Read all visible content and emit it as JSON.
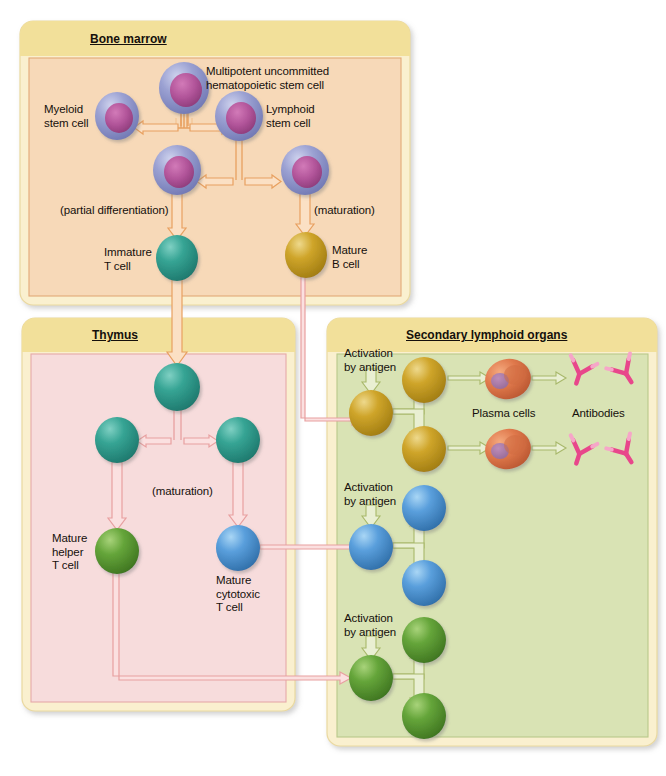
{
  "figure": {
    "panels": [
      {
        "id": "bone-marrow",
        "title": "Bone marrow",
        "header_color": "#f2e09a",
        "body_color": "#f7d9b8",
        "border_color": "#e2a977"
      },
      {
        "id": "thymus",
        "title": "Thymus",
        "header_color": "#f2e09a",
        "body_color": "#f7dcdc",
        "border_color": "#e6a9a9"
      },
      {
        "id": "secondary-lymphoid-organs",
        "title": "Secondary lymphoid organs",
        "header_color": "#f2e09a",
        "body_color": "#d9e3b4",
        "border_color": "#b9c98a"
      }
    ]
  },
  "bone_marrow": {
    "title": "Bone marrow",
    "labels": {
      "multipotent": "Multipotent uncommitted\nhematopoietic stem cell",
      "myeloid": "Myeloid\nstem cell",
      "lymphoid": "Lymphoid\nstem cell",
      "partial_differentiation": "(partial differentiation)",
      "maturation": "(maturation)",
      "immature_t": "Immature\nT cell",
      "mature_b": "Mature\nB cell"
    },
    "cells": [
      {
        "name": "multipotent-hematopoietic-stem-cell",
        "type": "stem",
        "cx": 184,
        "cy": 88,
        "r": 25
      },
      {
        "name": "myeloid-stem-cell",
        "type": "stem",
        "cx": 117,
        "cy": 116,
        "r": 22
      },
      {
        "name": "lymphoid-stem-cell",
        "type": "stem",
        "cx": 239,
        "cy": 116,
        "r": 24
      },
      {
        "name": "pre-t-cell",
        "type": "stem",
        "cx": 177,
        "cy": 170,
        "r": 24
      },
      {
        "name": "pre-b-cell",
        "type": "stem",
        "cx": 305,
        "cy": 170,
        "r": 24
      },
      {
        "name": "immature-t-cell",
        "type": "tcell",
        "cx": 177,
        "cy": 258,
        "r": 21
      },
      {
        "name": "mature-b-cell",
        "type": "bcell",
        "cx": 306,
        "cy": 255,
        "r": 21
      }
    ]
  },
  "thymus": {
    "title": "Thymus",
    "labels": {
      "maturation": "(maturation)",
      "mature_helper": "Mature\nhelper\nT cell",
      "mature_cytotoxic": "Mature\ncytotoxic\nT cell"
    },
    "cells": [
      {
        "name": "thymocyte",
        "type": "tcell",
        "cx": 177,
        "cy": 387,
        "r": 23
      },
      {
        "name": "thymocyte-left",
        "type": "tcell",
        "cx": 117,
        "cy": 440,
        "r": 22
      },
      {
        "name": "thymocyte-right",
        "type": "tcell",
        "cx": 238,
        "cy": 440,
        "r": 22
      },
      {
        "name": "mature-helper-t-cell",
        "type": "helper",
        "cx": 117,
        "cy": 551,
        "r": 22
      },
      {
        "name": "mature-cytotoxic-t-cell",
        "type": "cytotoxic",
        "cx": 238,
        "cy": 548,
        "r": 22
      }
    ]
  },
  "secondary": {
    "title": "Secondary lymphoid organs",
    "labels": {
      "activation_1": "Activation\nby antigen",
      "activation_2": "Activation\nby antigen",
      "activation_3": "Activation\nby antigen",
      "plasma_cells": "Plasma cells",
      "antibodies": "Antibodies"
    },
    "groups": [
      {
        "name": "b-cell-clone",
        "activated_cell": {
          "name": "activated-b-cell",
          "type": "bcell",
          "cx": 371,
          "cy": 413,
          "r": 22
        },
        "daughters": [
          {
            "name": "b-cell-daughter-upper",
            "type": "bcell",
            "cx": 424,
            "cy": 380,
            "r": 22
          },
          {
            "name": "b-cell-daughter-lower",
            "type": "bcell",
            "cx": 424,
            "cy": 449,
            "r": 22
          }
        ],
        "plasma_cells": [
          {
            "name": "plasma-cell-upper",
            "cx": 508,
            "cy": 379,
            "rx": 22,
            "ry": 19
          },
          {
            "name": "plasma-cell-lower",
            "cx": 508,
            "cy": 449,
            "rx": 22,
            "ry": 19
          }
        ],
        "antibodies": [
          {
            "name": "antibody-1",
            "cx": 580,
            "cy": 372
          },
          {
            "name": "antibody-2",
            "cx": 625,
            "cy": 372
          },
          {
            "name": "antibody-3",
            "cx": 580,
            "cy": 452
          },
          {
            "name": "antibody-4",
            "cx": 625,
            "cy": 452
          }
        ]
      },
      {
        "name": "cytotoxic-t-cell-clone",
        "activated_cell": {
          "name": "activated-cytotoxic-t-cell",
          "type": "cytotoxic",
          "cx": 371,
          "cy": 547,
          "r": 22
        },
        "daughters": [
          {
            "name": "cytotoxic-daughter-upper",
            "type": "cytotoxic",
            "cx": 424,
            "cy": 508,
            "r": 22
          },
          {
            "name": "cytotoxic-daughter-lower",
            "type": "cytotoxic",
            "cx": 424,
            "cy": 583,
            "r": 22
          }
        ],
        "plasma_cells": [],
        "antibodies": []
      },
      {
        "name": "helper-t-cell-clone",
        "activated_cell": {
          "name": "activated-helper-t-cell",
          "type": "helper",
          "cx": 371,
          "cy": 678,
          "r": 22
        },
        "daughters": [
          {
            "name": "helper-daughter-upper",
            "type": "helper",
            "cx": 424,
            "cy": 640,
            "r": 22
          },
          {
            "name": "helper-daughter-lower",
            "type": "helper",
            "cx": 424,
            "cy": 716,
            "r": 22
          }
        ],
        "plasma_cells": [],
        "antibodies": []
      }
    ]
  },
  "colors": {
    "stem_cell_rim": "#8b90c6",
    "stem_cell_nucleus": "#b25a9c",
    "t_cell": "#2e9e8f",
    "b_cell": "#c49a22",
    "helper_t_cell": "#5c9a37",
    "cytotoxic_t_cell": "#4f97d8",
    "plasma_cell": "#e07b4e",
    "antibody": "#e8478b",
    "arrow_orange": "#e8a060",
    "arrow_pink": "#e8a0a0",
    "arrow_green": "#a8b86a",
    "panel_header": "#f2e09a"
  }
}
